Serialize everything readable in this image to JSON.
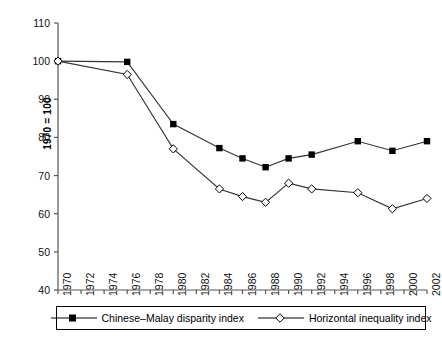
{
  "chart_data": {
    "type": "line",
    "title": "",
    "xlabel": "",
    "ylabel": "1970 = 100",
    "ylim": [
      40,
      110
    ],
    "ytick_values": [
      40,
      50,
      60,
      70,
      80,
      90,
      100,
      110
    ],
    "xlim": [
      1970,
      2002
    ],
    "xtick_values": [
      1970,
      1972,
      1974,
      1976,
      1978,
      1980,
      1982,
      1984,
      1986,
      1988,
      1990,
      1992,
      1994,
      1996,
      1998,
      2000,
      2002
    ],
    "grid": false,
    "legend_position": "bottom",
    "series": [
      {
        "name": "Chinese–Malay disparity index",
        "marker": "filled-square",
        "x": [
          1970,
          1976,
          1980,
          1984,
          1986,
          1988,
          1990,
          1992,
          1996,
          1999,
          2002
        ],
        "values": [
          100,
          99.8,
          83.5,
          77.2,
          74.5,
          72.2,
          74.5,
          75.5,
          79,
          76.5,
          79
        ]
      },
      {
        "name": "Horizontal inequality index",
        "marker": "open-diamond",
        "x": [
          1970,
          1976,
          1980,
          1984,
          1986,
          1988,
          1990,
          1992,
          1996,
          1999,
          2002
        ],
        "values": [
          100,
          96.5,
          77,
          66.5,
          64.5,
          63,
          68,
          66.5,
          65.5,
          61.3,
          64
        ]
      }
    ]
  },
  "axis": {
    "y_title": "1970 = 100",
    "y_ticks": [
      "110",
      "100",
      "90",
      "80",
      "70",
      "60",
      "50",
      "40"
    ],
    "x_ticks": [
      "1970",
      "1972",
      "1974",
      "1976",
      "1978",
      "1980",
      "1982",
      "1984",
      "1986",
      "1988",
      "1990",
      "1992",
      "1994",
      "1996",
      "1998",
      "2000",
      "2002"
    ]
  },
  "legend": {
    "entries": [
      {
        "label": "Chinese–Malay disparity index",
        "marker": "filled-square"
      },
      {
        "label": "Horizontal inequality index",
        "marker": "open-diamond"
      }
    ]
  },
  "colors": {
    "axis": "#555555",
    "series_line": "#333333",
    "marker_fill": "#000000",
    "marker_open": "#ffffff",
    "background": "#ffffff"
  }
}
